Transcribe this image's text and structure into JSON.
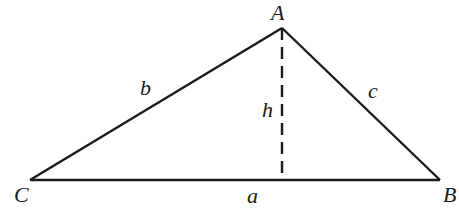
{
  "diagram": {
    "type": "triangle-with-altitude",
    "vertices": {
      "A": {
        "label": "A",
        "x": 282,
        "y": 28
      },
      "B": {
        "label": "B",
        "x": 440,
        "y": 180
      },
      "C": {
        "label": "C",
        "x": 30,
        "y": 180
      }
    },
    "altitude_foot": {
      "x": 282,
      "y": 180
    },
    "sides": {
      "a": {
        "label": "a",
        "between": [
          "C",
          "B"
        ]
      },
      "b": {
        "label": "b",
        "between": [
          "C",
          "A"
        ]
      },
      "c": {
        "label": "c",
        "between": [
          "A",
          "B"
        ]
      }
    },
    "altitude": {
      "label": "h",
      "style": "dashed",
      "from": "A"
    },
    "colors": {
      "stroke": "#1a1a1a",
      "background": "#ffffff"
    }
  }
}
